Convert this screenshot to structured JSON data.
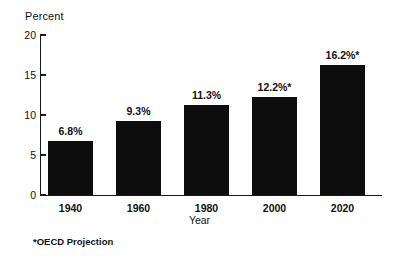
{
  "chart_data": {
    "type": "bar",
    "title": "",
    "xlabel": "Year",
    "ylabel": "Percent",
    "categories": [
      "1940",
      "1960",
      "1980",
      "2000",
      "2020"
    ],
    "values": [
      6.8,
      9.3,
      11.3,
      12.2,
      16.2
    ],
    "data_labels": [
      "6.8%",
      "9.3%",
      "11.3%",
      "12.2%*",
      "16.2%*"
    ],
    "ylim": [
      0,
      20
    ],
    "yticks": [
      0,
      5,
      10,
      15,
      20
    ],
    "ytick_labels": [
      "0",
      "5",
      "10",
      "15",
      "20"
    ],
    "grid": false,
    "legend": null,
    "bar_color": "#0d0d0d",
    "axis_color": "#1a1a1a",
    "background_color": "#ffffff",
    "annotations": [
      "*OECD Projection"
    ],
    "projection_marker": "*",
    "projected_categories": [
      "2000",
      "2020"
    ]
  },
  "axis": {
    "y_title": "Percent",
    "x_title": "Year"
  },
  "ticks": {
    "y": [
      {
        "label": "20",
        "value": 20
      },
      {
        "label": "15",
        "value": 15
      },
      {
        "label": "10",
        "value": 10
      },
      {
        "label": "5",
        "value": 5
      },
      {
        "label": "0",
        "value": 0
      }
    ],
    "x": [
      {
        "label": "1940"
      },
      {
        "label": "1960"
      },
      {
        "label": "1980"
      },
      {
        "label": "2000"
      },
      {
        "label": "2020"
      }
    ]
  },
  "bars": [
    {
      "category": "1940",
      "value": 6.8,
      "label": "6.8%"
    },
    {
      "category": "1960",
      "value": 9.3,
      "label": "9.3%"
    },
    {
      "category": "1980",
      "value": 11.3,
      "label": "11.3%"
    },
    {
      "category": "2000",
      "value": 12.2,
      "label": "12.2%*"
    },
    {
      "category": "2020",
      "value": 16.2,
      "label": "16.2%*"
    }
  ],
  "footnote": {
    "text": "*OECD Projection"
  }
}
